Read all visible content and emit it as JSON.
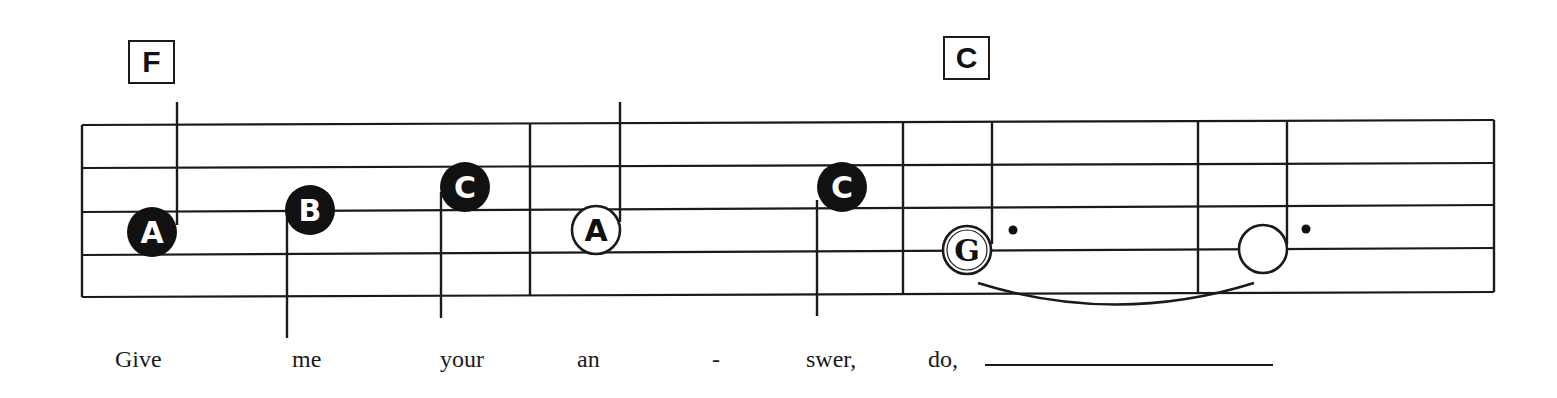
{
  "chords": [
    {
      "label": "F",
      "x": 128,
      "y": 40
    },
    {
      "label": "C",
      "x": 943,
      "y": 36
    }
  ],
  "staff": {
    "left": 82,
    "right": 1494,
    "lines_left_y": [
      125,
      168,
      212,
      255,
      297
    ],
    "lines_right_y": [
      120,
      163,
      205,
      248,
      292
    ],
    "barlines_x": [
      82,
      530,
      903,
      1198,
      1494
    ]
  },
  "notes": [
    {
      "letter": "A",
      "style": "filled",
      "cx": 152,
      "cy": 232,
      "r": 25,
      "stem_x": 177,
      "stem_y1": 102,
      "stem_y2": 225
    },
    {
      "letter": "B",
      "style": "filled",
      "cx": 310,
      "cy": 210,
      "r": 25,
      "stem_x": 287,
      "stem_y1": 212,
      "stem_y2": 338
    },
    {
      "letter": "C",
      "style": "filled",
      "cx": 465,
      "cy": 187,
      "r": 25,
      "stem_x": 441,
      "stem_y1": 192,
      "stem_y2": 318
    },
    {
      "letter": "A",
      "style": "open",
      "cx": 596,
      "cy": 230,
      "r": 24,
      "stem_x": 620,
      "stem_y1": 102,
      "stem_y2": 222
    },
    {
      "letter": "C",
      "style": "filled",
      "cx": 842,
      "cy": 187,
      "r": 25,
      "stem_x": 817,
      "stem_y1": 200,
      "stem_y2": 316
    },
    {
      "letter": "G",
      "style": "open-double",
      "cx": 967,
      "cy": 250,
      "r": 24,
      "stem_x": 992,
      "stem_y1": 122,
      "stem_y2": 244,
      "dot": {
        "x": 1013,
        "y": 230
      }
    },
    {
      "letter": "",
      "style": "open",
      "cx": 1263,
      "cy": 249,
      "r": 24,
      "stem_x": 1287,
      "stem_y1": 122,
      "stem_y2": 244,
      "dot": {
        "x": 1306,
        "y": 229
      }
    }
  ],
  "tie": {
    "x1": 978,
    "y1": 283,
    "cx": 1116,
    "cy": 326,
    "x2": 1254,
    "y2": 283
  },
  "lyrics": [
    {
      "text": "Give",
      "x": 115
    },
    {
      "text": "me",
      "x": 292
    },
    {
      "text": "your",
      "x": 440
    },
    {
      "text": "an",
      "x": 577
    },
    {
      "text": "-",
      "x": 712
    },
    {
      "text": "swer,",
      "x": 806
    },
    {
      "text": "do,",
      "x": 928
    }
  ],
  "extender": {
    "x1": 985,
    "x2": 1273,
    "y": 364
  }
}
